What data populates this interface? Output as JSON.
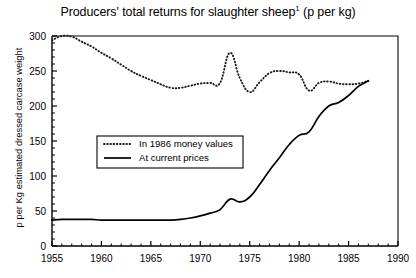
{
  "chart_data": {
    "type": "line",
    "title": "Producers' total returns for slaughter sheep",
    "title_footnote_marker": "1",
    "title_units": "(p per kg)",
    "xlabel": "",
    "ylabel": "p per Kg estimated dressed carcase weight",
    "xlim": [
      1955,
      1990
    ],
    "ylim": [
      0,
      300
    ],
    "x_ticks": [
      1955,
      1960,
      1965,
      1970,
      1975,
      1980,
      1985,
      1990
    ],
    "x_tick_labels": [
      "1955",
      "1960",
      "1965",
      "1970",
      "1975",
      "1980",
      "1985",
      "1990"
    ],
    "x_minor_tick_step": 1,
    "y_ticks": [
      0,
      50,
      100,
      150,
      200,
      250,
      300
    ],
    "y_tick_labels": [
      "0",
      "50",
      "100",
      "150",
      "200",
      "250",
      "300"
    ],
    "y_minor_tick_step": 10,
    "grid": false,
    "legend_position": "center-left",
    "frame": true,
    "series": [
      {
        "name": "In 1986 money values",
        "style": "dotted",
        "color": "#1a1a1a",
        "x": [
          1955,
          1956,
          1957,
          1958,
          1959,
          1960,
          1961,
          1962,
          1963,
          1964,
          1965,
          1966,
          1967,
          1968,
          1969,
          1970,
          1971,
          1972,
          1973,
          1974,
          1975,
          1976,
          1977,
          1978,
          1979,
          1980,
          1981,
          1982,
          1983,
          1984,
          1985,
          1986,
          1987
        ],
        "values": [
          294,
          300,
          299,
          292,
          285,
          276,
          268,
          259,
          250,
          243,
          237,
          231,
          226,
          226,
          229,
          232,
          233,
          233,
          276,
          240,
          220,
          234,
          247,
          250,
          248,
          245,
          222,
          233,
          235,
          232,
          231,
          232,
          236
        ]
      },
      {
        "name": "At current prices",
        "style": "solid",
        "color": "#000000",
        "x": [
          1955,
          1956,
          1957,
          1958,
          1959,
          1960,
          1961,
          1962,
          1963,
          1964,
          1965,
          1966,
          1967,
          1968,
          1969,
          1970,
          1971,
          1972,
          1973,
          1974,
          1975,
          1976,
          1977,
          1978,
          1979,
          1980,
          1981,
          1982,
          1983,
          1984,
          1985,
          1986,
          1987
        ],
        "values": [
          37,
          38,
          38,
          38,
          38,
          37,
          37,
          37,
          37,
          37,
          37,
          37,
          37,
          38,
          40,
          43,
          47,
          52,
          67,
          63,
          70,
          88,
          108,
          126,
          145,
          158,
          163,
          185,
          200,
          205,
          215,
          228,
          236
        ]
      }
    ],
    "legend_entries": [
      {
        "label": "In 1986 money values",
        "style": "dotted"
      },
      {
        "label": "At current prices",
        "style": "solid"
      }
    ]
  }
}
